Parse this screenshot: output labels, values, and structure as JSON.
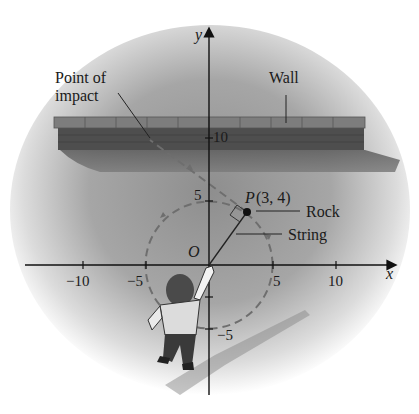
{
  "figure": {
    "labels": {
      "y_axis": "y",
      "x_axis": "x",
      "origin": "O",
      "point_name": "P",
      "point_coords": "(3, 4)",
      "rock": "Rock",
      "string": "String",
      "wall": "Wall",
      "impact_line1": "Point of",
      "impact_line2": "impact"
    },
    "x_ticks": [
      "−10",
      "−5",
      "5",
      "10"
    ],
    "y_ticks": [
      "10",
      "5",
      "−5"
    ],
    "point": {
      "x": 3,
      "y": 4
    },
    "circle_radius": 5,
    "colors": {
      "background_shade": "#9a9a9a",
      "wall_top": "#7b7b7b",
      "wall_front": "#4e4e4e",
      "wall_shadow": "#6a6a6a",
      "axis": "#111111",
      "dashed_path": "#6e6e6e"
    }
  }
}
